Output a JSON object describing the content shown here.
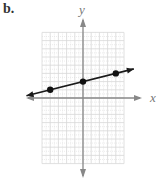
{
  "panel_label": "b.",
  "chart_data": {
    "type": "line",
    "title": "",
    "xlabel": "x",
    "ylabel": "y",
    "xlim": [
      -5,
      5
    ],
    "ylim": [
      -8,
      8
    ],
    "grid": true,
    "legend": null,
    "points": [
      {
        "x": -4,
        "y": 1
      },
      {
        "x": 0,
        "y": 2
      },
      {
        "x": 4,
        "y": 3
      }
    ],
    "line": {
      "slope": 0.25,
      "intercept": 2,
      "arrows_both_ends": true
    },
    "colors": {
      "grid": "#d8d8d8",
      "axis": "#888888",
      "line": "#1a1a1a",
      "points": "#111111"
    }
  }
}
